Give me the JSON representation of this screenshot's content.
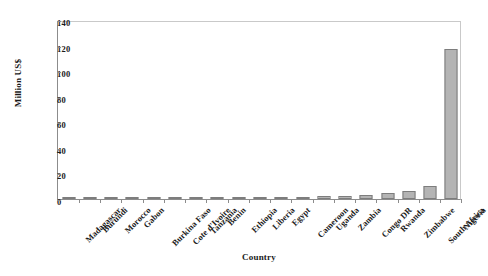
{
  "chart_data": {
    "type": "bar",
    "title": "",
    "xlabel": "Country",
    "ylabel": "Million US$",
    "categories": [
      "Madagascar",
      "Burundi",
      "Morocco",
      "Gabon",
      "Burkina Faso",
      "Cote d'Ivoire",
      "Tanzania",
      "Benin",
      "Ethiopia",
      "Liberia",
      "Egypt",
      "Cameroon",
      "Uganda",
      "Zambia",
      "Congo DR",
      "Rwanda",
      "Zimbabwe",
      "South Africa",
      "Nigeria"
    ],
    "values": [
      0.2,
      0.3,
      0.4,
      0.5,
      0.6,
      0.8,
      1.0,
      1.2,
      1.3,
      1.5,
      1.6,
      1.8,
      2.2,
      2.6,
      3.2,
      5.0,
      6.5,
      10.0,
      117.0
    ],
    "ylim": [
      0,
      140
    ],
    "yticks": [
      0,
      20,
      40,
      60,
      80,
      100,
      120,
      140
    ],
    "ytick_labels": [
      "0",
      "20",
      "40",
      "60",
      "80",
      "100",
      "120",
      "140"
    ],
    "grid": false,
    "legend": "none",
    "bar_color": "#b4b4b4",
    "bar_edge_color": "#7d7d7d",
    "axis_color": "#8c8c8c",
    "background_color": "#ffffff"
  }
}
